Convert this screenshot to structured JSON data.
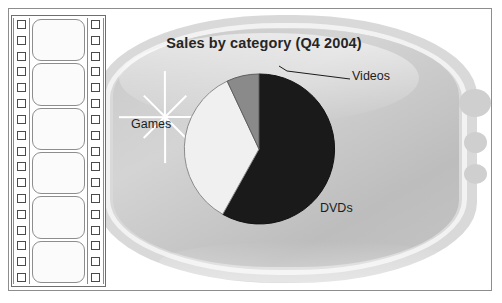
{
  "chart_data": {
    "type": "pie",
    "title": "Sales by category (Q4 2004)",
    "categories": [
      "DVDs",
      "Games",
      "Videos"
    ],
    "values": [
      58,
      35,
      7
    ],
    "labels": [
      "DVDs",
      "Games",
      "Videos"
    ],
    "colors": [
      "#1a1a1a",
      "#f0f0f0",
      "#8a8a8a"
    ],
    "legend": "none",
    "annotations": [
      "Videos slice is labelled with a leader line"
    ],
    "xlabel": "",
    "ylabel": ""
  },
  "chart": {
    "title": "Sales by category (Q4 2004)",
    "slices": [
      {
        "label": "DVDs",
        "value": 58,
        "color": "#1a1a1a"
      },
      {
        "label": "Games",
        "value": 35,
        "color": "#f0f0f0"
      },
      {
        "label": "Videos",
        "value": 7,
        "color": "#8a8a8a"
      }
    ]
  },
  "decor": {
    "filmstrip_frame_count": 6,
    "sprocket_hole_count": 17,
    "knob_count": 3,
    "starburst": "sparkle-icon"
  }
}
